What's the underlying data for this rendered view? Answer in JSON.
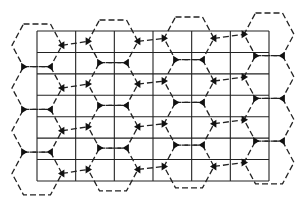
{
  "diagram": {
    "title": "",
    "grid": {
      "columns": 6,
      "rows": 7
    },
    "hexagon_columns": 4,
    "hexagons_per_column": 4,
    "colors": {
      "line": "#222222",
      "node": "#111111",
      "background": "#ffffff"
    }
  }
}
